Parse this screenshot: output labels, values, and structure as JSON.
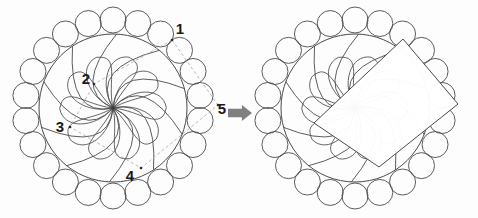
{
  "figure": {
    "title": "",
    "background_color": "#fdfdfd",
    "stroke_color": "#4a4a4a",
    "dashed_color": "#b0b0b0",
    "arrow_color": "#808080",
    "overlay_fill": "#ffffff",
    "width": 478,
    "height": 218
  },
  "diagrams": [
    {
      "id": "left-rosette",
      "name": "rosette-with-construction-lines",
      "center": {
        "x": 113,
        "y": 108
      },
      "outer_ring": {
        "circle_count": 22,
        "ring_radius": 88,
        "circle_radius": 13
      },
      "inner_disc_radius": 74,
      "spiral_arms": 10,
      "petal_count": 10
    },
    {
      "id": "right-rosette",
      "name": "rosette-with-square-overlay",
      "center": {
        "x": 355,
        "y": 108
      },
      "outer_ring": {
        "circle_count": 22,
        "ring_radius": 88,
        "circle_radius": 13
      },
      "inner_disc_radius": 74,
      "spiral_arms": 10,
      "petal_count": 10,
      "overlay_quad": [
        {
          "x": 403,
          "y": 39
        },
        {
          "x": 458,
          "y": 104
        },
        {
          "x": 379,
          "y": 167
        },
        {
          "x": 314,
          "y": 123
        }
      ]
    }
  ],
  "annotations": {
    "points": [
      {
        "label": "1",
        "marker_x": 172,
        "marker_y": 40,
        "text_x": 180,
        "text_y": 30
      },
      {
        "label": "2",
        "marker_x": 94,
        "marker_y": 84,
        "text_x": 86,
        "text_y": 80
      },
      {
        "label": "3",
        "marker_x": 70,
        "marker_y": 127,
        "text_x": 60,
        "text_y": 128
      },
      {
        "label": "4",
        "marker_x": 141,
        "marker_y": 168,
        "text_x": 130,
        "text_y": 177
      },
      {
        "label": "5",
        "marker_x": 218,
        "marker_y": 105,
        "text_x": 222,
        "text_y": 110
      }
    ],
    "dashed_polygon": [
      {
        "x": 172,
        "y": 40
      },
      {
        "x": 94,
        "y": 84
      },
      {
        "x": 70,
        "y": 127
      },
      {
        "x": 141,
        "y": 168
      },
      {
        "x": 218,
        "y": 105
      }
    ]
  },
  "arrow": {
    "label": "transform-arrow",
    "x": 228,
    "y": 113,
    "width": 24,
    "height": 16,
    "direction": "right",
    "color": "#808080"
  }
}
